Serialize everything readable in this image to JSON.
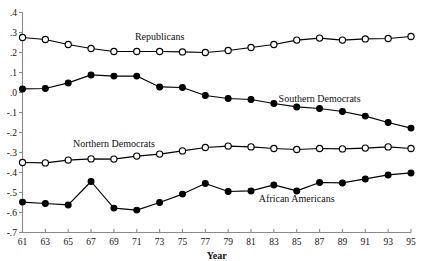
{
  "chart_data": {
    "type": "line",
    "title": "",
    "xlabel": "Year",
    "ylabel": "",
    "xlim": [
      61,
      95
    ],
    "ylim": [
      -0.7,
      0.4
    ],
    "grid": false,
    "legend_position": "inline-annotations",
    "x": [
      61,
      63,
      65,
      67,
      69,
      71,
      73,
      75,
      77,
      79,
      81,
      83,
      85,
      87,
      89,
      91,
      93,
      95
    ],
    "xtick_labels": [
      "61",
      "63",
      "65",
      "67",
      "69",
      "71",
      "73",
      "75",
      "77",
      "79",
      "81",
      "83",
      "85",
      "87",
      "89",
      "91",
      "93",
      "95"
    ],
    "ytick_labels": [
      ".4",
      ".3",
      ".2",
      ".1",
      ".0",
      "-.1",
      "-.2",
      "-.3",
      "-.4",
      "-.5",
      "-.6",
      "-.7"
    ],
    "ytick_values": [
      0.4,
      0.3,
      0.2,
      0.1,
      0.0,
      -0.1,
      -0.2,
      -0.3,
      -0.4,
      -0.5,
      -0.6,
      -0.7
    ],
    "series": [
      {
        "name": "Republicans",
        "marker": "open-circle",
        "label_x": 73,
        "label_y": 0.265,
        "values": [
          0.275,
          0.265,
          0.24,
          0.22,
          0.205,
          0.205,
          0.205,
          0.203,
          0.2,
          0.21,
          0.225,
          0.24,
          0.262,
          0.272,
          0.262,
          0.268,
          0.27,
          0.28
        ]
      },
      {
        "name": "Southern Democrats",
        "marker": "closed-circle",
        "label_x": 87,
        "label_y": -0.045,
        "values": [
          0.018,
          0.02,
          0.048,
          0.088,
          0.082,
          0.082,
          0.028,
          0.025,
          -0.015,
          -0.03,
          -0.035,
          -0.055,
          -0.072,
          -0.08,
          -0.095,
          -0.118,
          -0.15,
          -0.178
        ]
      },
      {
        "name": "Northern Democrats",
        "marker": "open-circle",
        "label_x": 69,
        "label_y": -0.272,
        "values": [
          -0.35,
          -0.352,
          -0.338,
          -0.332,
          -0.333,
          -0.318,
          -0.308,
          -0.292,
          -0.275,
          -0.268,
          -0.272,
          -0.28,
          -0.285,
          -0.28,
          -0.282,
          -0.278,
          -0.272,
          -0.28
        ]
      },
      {
        "name": "African Americans",
        "marker": "closed-circle",
        "label_x": 85,
        "label_y": -0.545,
        "values": [
          -0.548,
          -0.555,
          -0.562,
          -0.445,
          -0.578,
          -0.588,
          -0.55,
          -0.508,
          -0.455,
          -0.495,
          -0.492,
          -0.462,
          -0.492,
          -0.45,
          -0.452,
          -0.432,
          -0.412,
          -0.402
        ]
      }
    ]
  }
}
